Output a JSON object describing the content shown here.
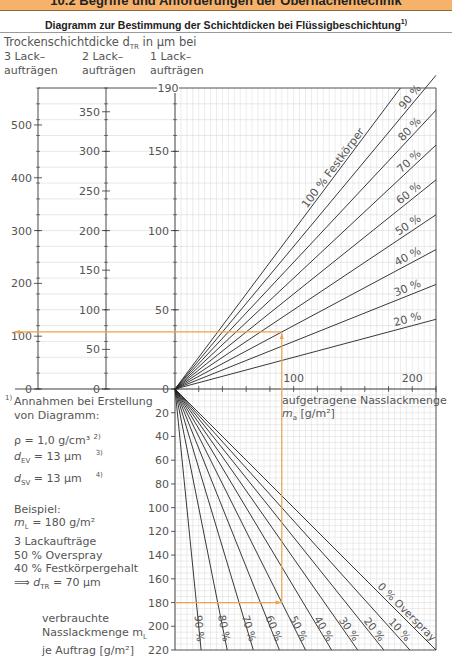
{
  "header": {
    "section_title": "10.2 Begriffe und Anforderungen der Oberflächentechnik",
    "diagram_title": "Diagramm zur Bestimmung der Schichtdicken bei Flüssigbeschichtung",
    "diagram_title_footnote": "1)"
  },
  "axes_labels": {
    "dry_thickness": "Trockenschichtdicke d",
    "dry_thickness_sub": "TR",
    "dry_thickness_unit": " in µm bei",
    "col3_line1": "3 Lack–",
    "col3_line2": "aufträgen",
    "col2_line1": "2 Lack–",
    "col2_line2": "aufträgen",
    "col1_line1": "1 Lack–",
    "col1_line2": "aufträgen",
    "applied_line1": "aufgetragene Nasslackmenge",
    "applied_line2": "m",
    "applied_sub": "a",
    "applied_unit": " [g/m²]",
    "consumed_line1": "verbrauchte",
    "consumed_line2": "Nasslackmenge m",
    "consumed_sub": "L",
    "consumed_line3": "je Auftrag [g/m²]"
  },
  "notes": {
    "footnote_mark": "1)",
    "assumptions_line1": "Annahmen bei Erstellung",
    "assumptions_line2": "von Diagramm:",
    "rho": "ρ = 1,0 g/cm³",
    "rho_ref": "2)",
    "dev": "= 13 µm",
    "dev_ref": "3)",
    "dsv": "= 13 µm",
    "dsv_ref": "4)",
    "example_title": "Beispiel:",
    "example_ml": "= 180 g/m²",
    "example_coats": "3 Lackaufträge",
    "example_overspray": "50 % Overspray",
    "example_solids": "40 % Festkörpergehalt",
    "example_result": "= 70 µm"
  },
  "chart_data": [
    {
      "type": "line",
      "title": "Diagramm zur Bestimmung der Schichtdicken bei Flüssigbeschichtung",
      "xlabel": "aufgetragene Nasslackmenge m_a [g/m²]",
      "ylabel": "Trockenschichtdicke d_TR in µm",
      "xlim": [
        0,
        220
      ],
      "ylim_1_coat": [
        0,
        190
      ],
      "ylim_2_coats": [
        0,
        380
      ],
      "ylim_3_coats": [
        0,
        570
      ],
      "x_ticks": [
        100,
        200
      ],
      "y_ticks_1_coat": [
        0,
        50,
        100,
        150,
        190
      ],
      "y_ticks_2_coats": [
        0,
        50,
        100,
        150,
        200,
        250,
        300,
        350
      ],
      "y_ticks_3_coats": [
        0,
        100,
        200,
        300,
        400,
        500
      ],
      "series": [
        {
          "name": "100 % Festkörper",
          "solids_pct": 100,
          "x": [
            0,
            190
          ],
          "y": [
            0,
            190
          ]
        },
        {
          "name": "90 %",
          "solids_pct": 90,
          "x": [
            0,
            220
          ],
          "y": [
            0,
            198
          ]
        },
        {
          "name": "80 %",
          "solids_pct": 80,
          "x": [
            0,
            220
          ],
          "y": [
            0,
            176
          ]
        },
        {
          "name": "70 %",
          "solids_pct": 70,
          "x": [
            0,
            220
          ],
          "y": [
            0,
            154
          ]
        },
        {
          "name": "60 %",
          "solids_pct": 60,
          "x": [
            0,
            220
          ],
          "y": [
            0,
            132
          ]
        },
        {
          "name": "50 %",
          "solids_pct": 50,
          "x": [
            0,
            220
          ],
          "y": [
            0,
            110
          ]
        },
        {
          "name": "40 %",
          "solids_pct": 40,
          "x": [
            0,
            220
          ],
          "y": [
            0,
            88
          ]
        },
        {
          "name": "30 %",
          "solids_pct": 30,
          "x": [
            0,
            220
          ],
          "y": [
            0,
            66
          ]
        },
        {
          "name": "20 %",
          "solids_pct": 20,
          "x": [
            0,
            220
          ],
          "y": [
            0,
            44
          ]
        }
      ],
      "grid": true
    },
    {
      "type": "line",
      "xlabel": "aufgetragene Nasslackmenge m_a [g/m²]",
      "ylabel": "verbrauchte Nasslackmenge m_L je Auftrag [g/m²]",
      "ylim": [
        0,
        220
      ],
      "y_ticks": [
        20,
        40,
        60,
        80,
        100,
        120,
        140,
        160,
        180,
        200,
        220
      ],
      "series": [
        {
          "name": "0 % Overspray",
          "overspray_pct": 0,
          "x": [
            0,
            220
          ],
          "y": [
            0,
            220
          ]
        },
        {
          "name": "10 %",
          "overspray_pct": 10,
          "x": [
            0,
            198
          ],
          "y": [
            0,
            220
          ]
        },
        {
          "name": "20 %",
          "overspray_pct": 20,
          "x": [
            0,
            176
          ],
          "y": [
            0,
            220
          ]
        },
        {
          "name": "30 %",
          "overspray_pct": 30,
          "x": [
            0,
            154
          ],
          "y": [
            0,
            220
          ]
        },
        {
          "name": "40 %",
          "overspray_pct": 40,
          "x": [
            0,
            132
          ],
          "y": [
            0,
            220
          ]
        },
        {
          "name": "50 %",
          "overspray_pct": 50,
          "x": [
            0,
            110
          ],
          "y": [
            0,
            220
          ]
        },
        {
          "name": "60 %",
          "overspray_pct": 60,
          "x": [
            0,
            88
          ],
          "y": [
            0,
            220
          ]
        },
        {
          "name": "70 %",
          "overspray_pct": 70,
          "x": [
            0,
            66
          ],
          "y": [
            0,
            220
          ]
        },
        {
          "name": "80 %",
          "overspray_pct": 80,
          "x": [
            0,
            44
          ],
          "y": [
            0,
            220
          ]
        },
        {
          "name": "90 %",
          "overspray_pct": 90,
          "x": [
            0,
            22
          ],
          "y": [
            0,
            220
          ]
        }
      ],
      "example_path": {
        "m_L": 180,
        "overspray_pct": 50,
        "m_a": 90,
        "solids_pct": 40,
        "coats": 3,
        "d_TR_um": 70
      },
      "grid": true
    }
  ],
  "colors": {
    "banner": "#f6b26b",
    "example_path": "#f0a050",
    "grid": "#d8d8d8",
    "lines": "#222222",
    "text": "#555555"
  }
}
